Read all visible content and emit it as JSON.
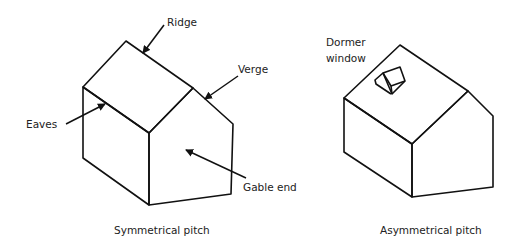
{
  "diagram": {
    "left_house": {
      "caption": "Symmetrical pitch",
      "labels": {
        "ridge": "Ridge",
        "verge": "Verge",
        "eaves": "Eaves",
        "gable_end": "Gable end"
      }
    },
    "right_house": {
      "caption": "Asymmetrical pitch",
      "labels": {
        "dormer_line1": "Dormer",
        "dormer_line2": "window"
      }
    },
    "colors": {
      "stroke": "#111111",
      "text": "#222222",
      "background": "#ffffff"
    }
  }
}
